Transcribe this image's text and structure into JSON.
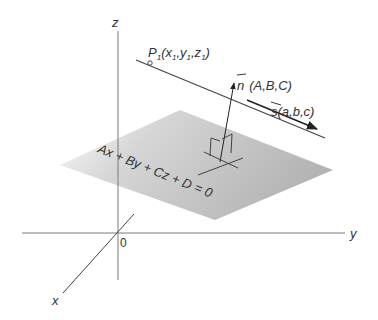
{
  "diagram": {
    "title": "",
    "colors": {
      "axis": "#7a7a7a",
      "line": "#444444",
      "plane_light": "#f2f2f2",
      "plane_dark": "#b9b9b9",
      "text": "#333333"
    },
    "axes": {
      "x_label": "x",
      "y_label": "y",
      "z_label": "z",
      "origin_label": "0"
    },
    "point": {
      "name": "P",
      "subscript": "1",
      "coords_label": "(x",
      "x_sub": "1",
      "sep1": ",y",
      "y_sub": "1",
      "sep2": ",z",
      "z_sub": "1",
      "close": ")"
    },
    "normal_vector": {
      "symbol": "n",
      "components": "(A,B,C)"
    },
    "direction_vector": {
      "symbol": "s",
      "components": "(a,b,c)"
    },
    "plane_equation": "Ax + By + Cz + D = 0"
  }
}
